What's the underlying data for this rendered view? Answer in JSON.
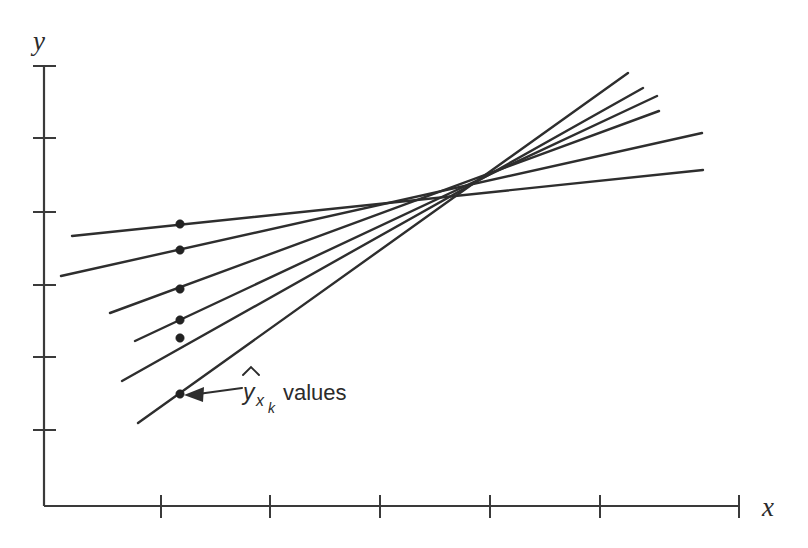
{
  "figure": {
    "background_color": "#ffffff",
    "line_color": "#2e2e2e",
    "axis_color": "#3a3a3a",
    "dot_color": "#222222",
    "axes": {
      "y_label": "y",
      "x_label": "x",
      "y_axis_x_px": 44,
      "y_axis_top_px": 66,
      "y_axis_bottom_px": 506,
      "x_axis_y_px": 506,
      "x_axis_left_px": 44,
      "x_axis_right_px": 739,
      "y_ticks_px": [
        66,
        138,
        212,
        285,
        357,
        430
      ],
      "x_ticks_px": [
        161,
        270,
        380,
        490,
        600,
        739
      ]
    },
    "annotation": {
      "symbol": "y",
      "hat": "̂",
      "subscript": "x",
      "sub_subscript": "k",
      "suffix": "values",
      "full_text": "ŷ_x_k values",
      "arrow_from_px": [
        242,
        388
      ],
      "arrow_to_px": [
        186,
        395
      ]
    }
  },
  "chart_data": {
    "type": "line",
    "title": "",
    "subtitle": "",
    "xlabel": "x",
    "ylabel": "y",
    "grid": false,
    "legend": null,
    "axis_pixel_ranges": {
      "x": [
        44,
        739
      ],
      "y": [
        66,
        506
      ]
    },
    "pivot_point_px": [
      468,
      196
    ],
    "marker_abscissa_px": 180,
    "series": [
      {
        "name": "line-1-flattest",
        "slope_rank": 1,
        "start_px": [
          72,
          236
        ],
        "end_px": [
          703,
          170
        ],
        "marker_px": [
          180,
          224
        ]
      },
      {
        "name": "line-2",
        "slope_rank": 2,
        "start_px": [
          61,
          276
        ],
        "end_px": [
          702,
          133
        ],
        "marker_px": [
          180,
          250
        ]
      },
      {
        "name": "line-3",
        "slope_rank": 3,
        "start_px": [
          110,
          313
        ],
        "end_px": [
          659,
          111
        ],
        "marker_px": [
          180,
          289
        ]
      },
      {
        "name": "line-4",
        "slope_rank": 4,
        "start_px": [
          135,
          341
        ],
        "end_px": [
          657,
          96
        ],
        "marker_px": [
          180,
          320
        ]
      },
      {
        "name": "line-5",
        "slope_rank": 5,
        "start_px": [
          122,
          381
        ],
        "end_px": [
          643,
          88
        ],
        "marker_px": [
          180,
          338
        ]
      },
      {
        "name": "line-6-steepest",
        "slope_rank": 6,
        "start_px": [
          138,
          423
        ],
        "end_px": [
          628,
          73
        ],
        "marker_px": [
          180,
          394
        ]
      }
    ],
    "markers": {
      "label": "ŷ_x_k values",
      "x_px": 180,
      "y_px": [
        224,
        250,
        289,
        320,
        338,
        394
      ],
      "radius_px": 4.2
    }
  }
}
